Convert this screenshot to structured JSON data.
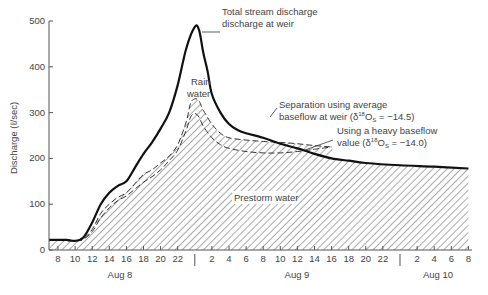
{
  "chart_data": {
    "type": "area",
    "title": "",
    "xlabel": "",
    "ylabel": "Discharge (ℓ/sec)",
    "ylim": [
      0,
      500
    ],
    "yticks": [
      0,
      100,
      200,
      300,
      400,
      500
    ],
    "xaxis": {
      "unit": "hour of day",
      "days": [
        {
          "label": "Aug 8",
          "ticks": [
            "8",
            "10",
            "12",
            "14",
            "16",
            "18",
            "20",
            "22"
          ]
        },
        {
          "label": "Aug 9",
          "ticks": [
            "2",
            "4",
            "6",
            "8",
            "10",
            "12",
            "14",
            "16",
            "18",
            "20",
            "22"
          ]
        },
        {
          "label": "Aug 10",
          "ticks": [
            "2",
            "4",
            "6",
            "8"
          ]
        }
      ]
    },
    "grid": false,
    "legend": "none (inline annotations)",
    "series": [
      {
        "name": "Total stream discharge at weir",
        "style": "solid thick",
        "x_hours_from_aug8_midnight": [
          7,
          9,
          10,
          11,
          12,
          13,
          14,
          15,
          16,
          17,
          18,
          19,
          20,
          21,
          22,
          23,
          24,
          24.5,
          25,
          25.5,
          26,
          27,
          28,
          29,
          30,
          32,
          34,
          36,
          38,
          40,
          42,
          44,
          48,
          52,
          56
        ],
        "values": [
          22,
          22,
          20,
          28,
          60,
          100,
          125,
          140,
          150,
          180,
          210,
          235,
          265,
          300,
          360,
          440,
          487,
          480,
          430,
          390,
          340,
          300,
          275,
          262,
          255,
          245,
          232,
          222,
          210,
          200,
          195,
          190,
          185,
          182,
          178
        ]
      },
      {
        "name": "Separation using average baseflow at weir (δ18Os = −14.5)",
        "style": "dashed",
        "x_hours_from_aug8_midnight": [
          7,
          10,
          11,
          12,
          13,
          14,
          15,
          16,
          17,
          18,
          19,
          20,
          21,
          22,
          23,
          23.5,
          24,
          24.5,
          25,
          26,
          27,
          28,
          30,
          32,
          34,
          36,
          38,
          40
        ],
        "values": [
          22,
          20,
          25,
          45,
          80,
          100,
          115,
          125,
          145,
          165,
          175,
          190,
          205,
          230,
          280,
          320,
          330,
          325,
          305,
          275,
          255,
          245,
          240,
          237,
          235,
          232,
          228,
          225
        ]
      },
      {
        "name": "Using a heavy baseflow value (δ18Os = −14.0)",
        "style": "dashed",
        "x_hours_from_aug8_midnight": [
          7,
          10,
          11,
          12,
          13,
          14,
          15,
          16,
          17,
          18,
          19,
          20,
          21,
          22,
          23,
          23.5,
          24,
          24.5,
          25,
          26,
          27,
          28,
          30,
          32,
          34,
          36,
          38,
          40
        ],
        "values": [
          22,
          20,
          24,
          40,
          70,
          92,
          108,
          118,
          133,
          148,
          160,
          175,
          195,
          218,
          262,
          290,
          298,
          290,
          270,
          245,
          230,
          222,
          215,
          212,
          212,
          215,
          220,
          225
        ]
      }
    ],
    "regions": [
      {
        "label": "Rain water",
        "description": "area between total discharge and baseflow separation"
      },
      {
        "label": "Prestorm water",
        "description": "hatched area beneath separation curve"
      }
    ],
    "annotations": [
      {
        "text_lines": [
          "Total stream discharge",
          "discharge at weir"
        ],
        "target": "peak of total discharge"
      },
      {
        "text_lines": [
          "Rain",
          "water"
        ],
        "target": "rain water region"
      },
      {
        "text_lines": [
          "Separation using average",
          "baseflow at weir (δ18Os = −14.5)"
        ],
        "target": "upper dashed curve"
      },
      {
        "text_lines": [
          "Using a heavy baseflow",
          "value (δ18Os = −14.0)"
        ],
        "target": "lower dashed curve"
      },
      {
        "text_lines": [
          "Prestorm water"
        ],
        "target": "hatched region"
      }
    ]
  },
  "labels": {
    "ylabel": "Discharge (ℓ/sec)",
    "yticks": [
      "0",
      "100",
      "200",
      "300",
      "400",
      "500"
    ],
    "ann_total_1": "Total stream discharge",
    "ann_total_2": "discharge at weir",
    "ann_rain_1": "Rain",
    "ann_rain_2": "water",
    "ann_sep_1": "Separation using average",
    "ann_sep_2": "baseflow at weir (δ",
    "ann_sep_sup": "18",
    "ann_sep_3": "O",
    "ann_sep_sub": "S",
    "ann_sep_4": " = −14.5)",
    "ann_heavy_1": "Using a heavy baseflow",
    "ann_heavy_2": "value (δ",
    "ann_heavy_sup": "18",
    "ann_heavy_3": "O",
    "ann_heavy_sub": "S",
    "ann_heavy_4": " = −14.0)",
    "ann_prestorm": "Prestorm water",
    "day_aug8": "Aug 8",
    "day_aug9": "Aug 9",
    "day_aug10": "Aug 10"
  }
}
